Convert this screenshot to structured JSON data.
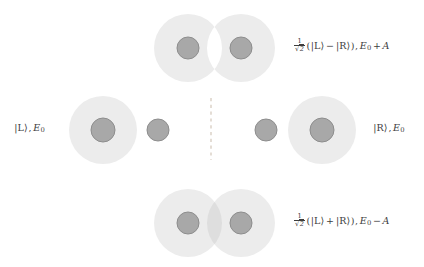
{
  "figure": {
    "background_color": "#ffffff",
    "cloud_color": "#ececec",
    "cloud_overlap_color": "#dedede",
    "nucleus_fill": "#a8a8a8",
    "nucleus_stroke": "#8e8e8e",
    "divider_color": "#d9cfc4",
    "text_color": "#3d3d3d"
  },
  "divider": {
    "name": "mirror-symmetry-axis",
    "style": "dashed",
    "orientation": "vertical",
    "x": 211,
    "y_top": 98,
    "y_bottom": 160
  },
  "states": {
    "top": {
      "id": "antisymmetric",
      "description": "antisymmetric combination with node between wells",
      "label": {
        "fraction_numerator": "1",
        "fraction_denominator_radical": "√",
        "fraction_denominator_radicand": "2",
        "open_paren": "(",
        "ket_left": "|L⟩",
        "operator": "−",
        "ket_right": "|R⟩",
        "close_paren": ")",
        "comma": ",",
        "energy_symbol": "E",
        "energy_subscript": "0",
        "energy_operator": "+",
        "energy_term": "A",
        "plain": "1/√2 (|L⟩ − |R⟩) , E₀ + A"
      },
      "geometry": {
        "cloud_left_cx": 188,
        "cloud_left_cy": 48,
        "cloud_r": 34,
        "cloud_right_cx": 241,
        "cloud_right_cy": 48,
        "nucleus_left_cx": 188,
        "nucleus_left_cy": 48,
        "nucleus_right_cx": 241,
        "nucleus_right_cy": 48,
        "nucleus_r": 11,
        "node": true
      }
    },
    "bottom": {
      "id": "symmetric",
      "description": "symmetric combination with constructive overlap between wells",
      "label": {
        "fraction_numerator": "1",
        "fraction_denominator_radical": "√",
        "fraction_denominator_radicand": "2",
        "open_paren": "(",
        "ket_left": "|L⟩",
        "operator": "+",
        "ket_right": "|R⟩",
        "close_paren": ")",
        "comma": ",",
        "energy_symbol": "E",
        "energy_subscript": "0",
        "energy_operator": "−",
        "energy_term": "A",
        "plain": "1/√2 (|L⟩ + |R⟩) , E₀ − A"
      },
      "geometry": {
        "cloud_left_cx": 188,
        "cloud_left_cy": 223,
        "cloud_r": 34,
        "cloud_right_cx": 241,
        "cloud_right_cy": 223,
        "nucleus_left_cx": 188,
        "nucleus_left_cy": 223,
        "nucleus_right_cx": 241,
        "nucleus_right_cy": 223,
        "nucleus_r": 11,
        "node": false
      }
    },
    "left": {
      "id": "localized-left",
      "description": "electron localized on the left nucleus",
      "label": {
        "ket": "|L⟩",
        "comma": ",",
        "energy_symbol": "E",
        "energy_subscript": "0",
        "plain": "|L⟩ , E₀"
      },
      "geometry": {
        "cloud_cx": 103,
        "cloud_cy": 130,
        "cloud_r": 34,
        "nucleus_main_cx": 103,
        "nucleus_main_cy": 130,
        "nucleus_main_r": 12,
        "nucleus_bare_cx": 158,
        "nucleus_bare_cy": 130,
        "nucleus_bare_r": 11
      }
    },
    "right": {
      "id": "localized-right",
      "description": "electron localized on the right nucleus",
      "label": {
        "ket": "|R⟩",
        "comma": ",",
        "energy_symbol": "E",
        "energy_subscript": "0",
        "plain": "|R⟩ , E₀"
      },
      "geometry": {
        "cloud_cx": 322,
        "cloud_cy": 130,
        "cloud_r": 34,
        "nucleus_main_cx": 322,
        "nucleus_main_cy": 130,
        "nucleus_main_r": 12,
        "nucleus_bare_cx": 266,
        "nucleus_bare_cy": 130,
        "nucleus_bare_r": 11
      }
    }
  }
}
